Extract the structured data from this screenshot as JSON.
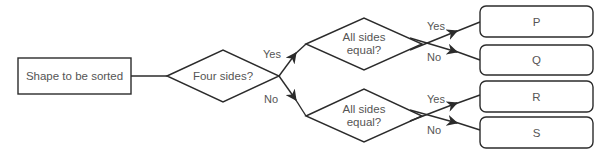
{
  "diagram": {
    "type": "flowchart",
    "start": {
      "label": "Shape to be sorted"
    },
    "decision_main": {
      "label": "Four sides?"
    },
    "decision_upper": {
      "line1": "All sides",
      "line2": "equal?"
    },
    "decision_lower": {
      "line1": "All sides",
      "line2": "equal?"
    },
    "outcomes": {
      "p": "P",
      "q": "Q",
      "r": "R",
      "s": "S"
    },
    "edges": {
      "main_yes": "Yes",
      "main_no": "No",
      "upper_yes": "Yes",
      "upper_no": "No",
      "lower_yes": "Yes",
      "lower_no": "No"
    },
    "colors": {
      "stroke": "#2b2b2b",
      "text": "#555555",
      "background": "#ffffff"
    }
  }
}
